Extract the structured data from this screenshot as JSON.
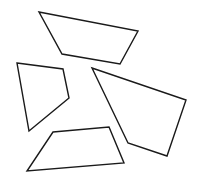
{
  "canvas": {
    "width": 197,
    "height": 186,
    "background": "#ffffff"
  },
  "stroke_color": "#1a1a1a",
  "shapes": [
    {
      "name": "top-quadrilateral",
      "points": "39,12 138,31 120,64 62,54"
    },
    {
      "name": "left-quadrilateral",
      "points": "17,63 63,69 69,98 29,131"
    },
    {
      "name": "right-quadrilateral",
      "points": "92,68 186,100 167,156 128,143"
    },
    {
      "name": "bottom-quadrilateral",
      "points": "53,132 109,127 124,163 27,171"
    }
  ]
}
